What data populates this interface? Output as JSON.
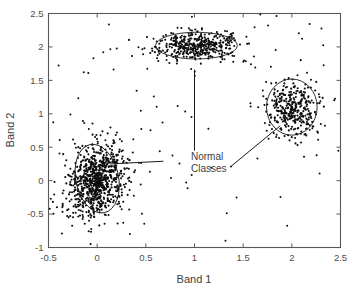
{
  "chart_data": {
    "type": "scatter",
    "title": "",
    "subtitle": "",
    "xlabel": "Band 1",
    "ylabel": "Band 2",
    "xlim": [
      -0.5,
      2.5
    ],
    "ylim": [
      -1,
      2.5
    ],
    "xticks": [
      "-0.5",
      "0",
      "0.5",
      "1",
      "1.5",
      "2",
      "2.5"
    ],
    "xtick_values": [
      -0.5,
      0,
      0.5,
      1,
      1.5,
      2,
      2.5
    ],
    "yticks": [
      "-1",
      "-0.5",
      "0",
      "0.5",
      "1",
      "1.5",
      "2",
      "2.5"
    ],
    "ytick_values": [
      -1,
      -0.5,
      0,
      0.5,
      1,
      1.5,
      2,
      2.5
    ],
    "grid": false,
    "legend_position": "none",
    "marker": "filled-circle",
    "marker_color": "#0d0d0d",
    "point_count": 1600,
    "annotations": [
      {
        "label_line_1": "Normal",
        "label_line_2": "Classes",
        "text": "Normal Classes",
        "x": 1.0,
        "y": 0.25,
        "leaders": [
          {
            "target_cluster": "top-cluster",
            "from": [
              1.0,
              0.45
            ],
            "to": [
              1.0,
              1.66
            ]
          },
          {
            "target_cluster": "right-cluster",
            "from": [
              1.38,
              0.22
            ],
            "to": [
              1.88,
              0.82
            ]
          },
          {
            "target_cluster": "left-cluster",
            "from": [
              0.68,
              0.29
            ],
            "to": [
              0.13,
              0.25
            ]
          }
        ]
      }
    ],
    "clusters": [
      {
        "name": "left-cluster",
        "label": "Normal Classes",
        "center": [
          0.0,
          0.0
        ],
        "n": 800,
        "sigma_x": 0.14,
        "sigma_y": 0.26,
        "rotation_deg": -12,
        "ellipse": {
          "cx": 0.0,
          "cy": 0.03,
          "rx": 0.22,
          "ry": 0.52,
          "rotation_deg": -12
        }
      },
      {
        "name": "top-cluster",
        "label": "Normal Classes",
        "center": [
          1.02,
          2.02
        ],
        "n": 400,
        "sigma_x": 0.2,
        "sigma_y": 0.1,
        "rotation_deg": 0,
        "ellipse": {
          "cx": 1.02,
          "cy": 2.02,
          "rx": 0.42,
          "ry": 0.2,
          "rotation_deg": 0
        }
      },
      {
        "name": "right-cluster",
        "label": "Normal Classes",
        "center": [
          2.0,
          1.08
        ],
        "n": 330,
        "sigma_x": 0.13,
        "sigma_y": 0.21,
        "rotation_deg": 0,
        "ellipse": {
          "cx": 2.0,
          "cy": 1.1,
          "rx": 0.26,
          "ry": 0.42,
          "rotation_deg": 0
        }
      }
    ],
    "outliers_note": "sparse scattered points between and around the three class ellipses"
  },
  "axes": {
    "x_title": "Band 1",
    "y_title": "Band 2",
    "x_tick_labels": [
      "-0.5",
      "0",
      "0.5",
      "1",
      "1.5",
      "2",
      "2.5"
    ],
    "y_tick_labels": [
      "2.5",
      "2",
      "1.5",
      "1",
      "0.5",
      "0",
      "-0.5",
      "-1"
    ]
  },
  "annotation": {
    "line1": "Normal",
    "line2": "Classes"
  },
  "colors": {
    "background": "#ffffff",
    "axis": "#595959",
    "tick_text": "#4d4d4d",
    "title_text": "#3d3d3d",
    "marker": "#0d0d0d",
    "ellipse": "#1a1a1a"
  }
}
